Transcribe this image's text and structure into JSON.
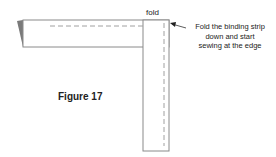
{
  "diagram": {
    "fold_label": "fold",
    "instruction_lines": [
      "Fold the binding strip",
      "down and start",
      "sewing at the edge"
    ],
    "figure_label": "Figure 17",
    "colors": {
      "outline": "#8a8a8a",
      "dash": "#a0a0a0",
      "folded_corner": "#7a7a7a",
      "text": "#222222"
    }
  }
}
